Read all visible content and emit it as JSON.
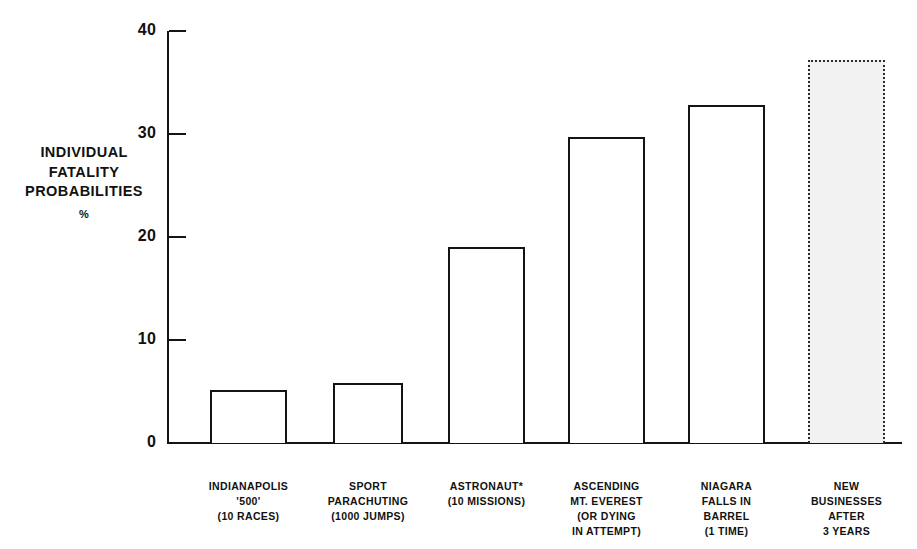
{
  "chart_data": {
    "type": "bar",
    "title": "",
    "subtitle": "",
    "xlabel": "",
    "ylabel": "INDIVIDUAL FATALITY PROBABILITIES",
    "ylabel_unit": "%",
    "ylim": [
      0,
      40
    ],
    "yticks": [
      0,
      10,
      20,
      30,
      40
    ],
    "ytick_labels": [
      "0",
      "10",
      "20",
      "30",
      "40"
    ],
    "grid": false,
    "legend": "none",
    "categories": [
      "INDIANAPOLIS '500' (10 RACES)",
      "SPORT PARACHUTING (1000 JUMPS)",
      "ASTRONAUT* (10 MISSIONS)",
      "ASCENDING MT. EVEREST (OR DYING IN ATTEMPT)",
      "NIAGARA FALLS IN BARREL (1 TIME)",
      "NEW BUSINESSES AFTER 3 YEARS"
    ],
    "values": [
      5.1,
      5.8,
      19.0,
      29.7,
      32.8,
      37.2
    ],
    "bar_styles": [
      "outline",
      "outline",
      "outline",
      "outline",
      "outline",
      "stippled"
    ]
  },
  "axis": {
    "y_title_line1": "INDIVIDUAL",
    "y_title_line2": "FATALITY",
    "y_title_line3": "PROBABILITIES",
    "y_unit": "%",
    "ticks": [
      {
        "value": 40,
        "label": "40"
      },
      {
        "value": 30,
        "label": "30"
      },
      {
        "value": 20,
        "label": "20"
      },
      {
        "value": 10,
        "label": "10"
      },
      {
        "value": 0,
        "label": "0"
      }
    ]
  },
  "bars": [
    {
      "id": "indianapolis-500",
      "value": 5.1,
      "lines": [
        "INDIANAPOLIS",
        "'500'",
        "(10 RACES)"
      ]
    },
    {
      "id": "sport-parachuting",
      "value": 5.8,
      "lines": [
        "SPORT",
        "PARACHUTING",
        "(1000 JUMPS)"
      ]
    },
    {
      "id": "astronaut",
      "value": 19.0,
      "lines": [
        "ASTRONAUT*",
        "(10 MISSIONS)"
      ]
    },
    {
      "id": "ascending-mt-everest",
      "value": 29.7,
      "lines": [
        "ASCENDING",
        "MT. EVEREST",
        "(OR DYING",
        "IN ATTEMPT)"
      ]
    },
    {
      "id": "niagara-falls-in-barrel",
      "value": 32.8,
      "lines": [
        "NIAGARA",
        "FALLS IN",
        "BARREL",
        "(1 TIME)"
      ]
    },
    {
      "id": "new-businesses-after-3-years",
      "value": 37.2,
      "lines": [
        "NEW",
        "BUSINESSES",
        "AFTER",
        "3 YEARS"
      ]
    }
  ],
  "colors": {
    "ink": "#141414",
    "paper": "#ffffff",
    "stipple": "#f2f2f2"
  }
}
